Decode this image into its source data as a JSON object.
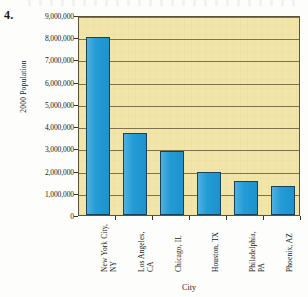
{
  "item_number": "4.",
  "chart_data": {
    "type": "bar",
    "title": "",
    "xlabel": "City",
    "ylabel": "2000 Population",
    "categories": [
      "New York City, NY",
      "Los Angeles, CA",
      "Chicago, IL",
      "Houston, TX",
      "Philadelphia, PA",
      "Phoenix, AZ"
    ],
    "category_lines": [
      [
        "New York City,",
        "NY"
      ],
      [
        "Los Angeles,",
        "CA"
      ],
      [
        "Chicago, IL",
        ""
      ],
      [
        "Houston, TX",
        ""
      ],
      [
        "Philadelphia,",
        "PA"
      ],
      [
        "Phoenix, AZ",
        ""
      ]
    ],
    "values": [
      8000000,
      3700000,
      2900000,
      1950000,
      1520000,
      1320000
    ],
    "ylim": [
      0,
      9000000
    ],
    "ytick_values": [
      0,
      1000000,
      2000000,
      3000000,
      4000000,
      5000000,
      6000000,
      7000000,
      8000000,
      9000000
    ],
    "ytick_labels": [
      "0",
      "1,000,000",
      "2,000,000",
      "3,000,000",
      "4,000,000",
      "5,000,000",
      "6,000,000",
      "7,000,000",
      "8,000,000",
      "9,000,000"
    ],
    "grid": true,
    "legend": false,
    "colors": {
      "bar_fill": "#1f9ad6",
      "bar_stroke": "#17425e",
      "plot_background": "#f1e5a9",
      "grid_line": "#6b5f3c",
      "axis": "#3a3425",
      "text": "#1a1a1a"
    }
  }
}
